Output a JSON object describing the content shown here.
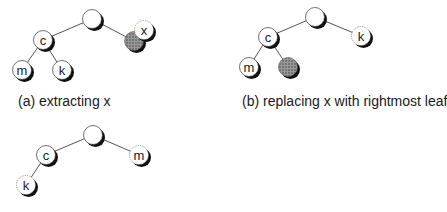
{
  "captions": {
    "a": "(a) extracting x",
    "b": "(b) replacing x with rightmost leaf"
  },
  "colors": {
    "edge": "#555555",
    "node_fill": "#ffffff",
    "node_stroke": "#333333",
    "shadow": "#111111",
    "shaded_fill": "#888888"
  },
  "diagrams": [
    {
      "id": "a",
      "nodes": [
        {
          "id": "root",
          "label": "",
          "x": 92,
          "y": 19,
          "style": "plain"
        },
        {
          "id": "c",
          "label": "c",
          "x": 43,
          "y": 40,
          "style": "plain"
        },
        {
          "id": "m",
          "label": "m",
          "x": 22,
          "y": 70,
          "style": "plain"
        },
        {
          "id": "k",
          "label": "k",
          "x": 62,
          "y": 70,
          "style": "plain"
        },
        {
          "id": "hole",
          "label": "",
          "x": 134,
          "y": 41,
          "style": "shaded"
        },
        {
          "id": "x",
          "label": "x",
          "x": 144,
          "y": 30,
          "style": "dotted"
        }
      ],
      "edges": [
        [
          "root",
          "c"
        ],
        [
          "c",
          "m"
        ],
        [
          "c",
          "k"
        ],
        [
          "root",
          "hole"
        ]
      ]
    },
    {
      "id": "b",
      "nodes": [
        {
          "id": "root",
          "label": "",
          "x": 315,
          "y": 17,
          "style": "plain"
        },
        {
          "id": "c",
          "label": "c",
          "x": 268,
          "y": 37,
          "style": "plain"
        },
        {
          "id": "m",
          "label": "m",
          "x": 249,
          "y": 67,
          "style": "plain"
        },
        {
          "id": "hole",
          "label": "",
          "x": 288,
          "y": 67,
          "style": "shaded"
        },
        {
          "id": "k",
          "label": "k",
          "x": 361,
          "y": 36,
          "style": "dotted"
        }
      ],
      "edges": [
        [
          "root",
          "c"
        ],
        [
          "c",
          "m"
        ],
        [
          "c",
          "hole"
        ],
        [
          "root",
          "k"
        ]
      ]
    },
    {
      "id": "c",
      "nodes": [
        {
          "id": "root",
          "label": "",
          "x": 93,
          "y": 135,
          "style": "plain"
        },
        {
          "id": "c",
          "label": "c",
          "x": 46,
          "y": 155,
          "style": "plain"
        },
        {
          "id": "m",
          "label": "m",
          "x": 139,
          "y": 155,
          "style": "dotted"
        },
        {
          "id": "k",
          "label": "k",
          "x": 26,
          "y": 185,
          "style": "dotted"
        }
      ],
      "edges": [
        [
          "root",
          "c"
        ],
        [
          "root",
          "m"
        ],
        [
          "c",
          "k"
        ]
      ]
    }
  ]
}
